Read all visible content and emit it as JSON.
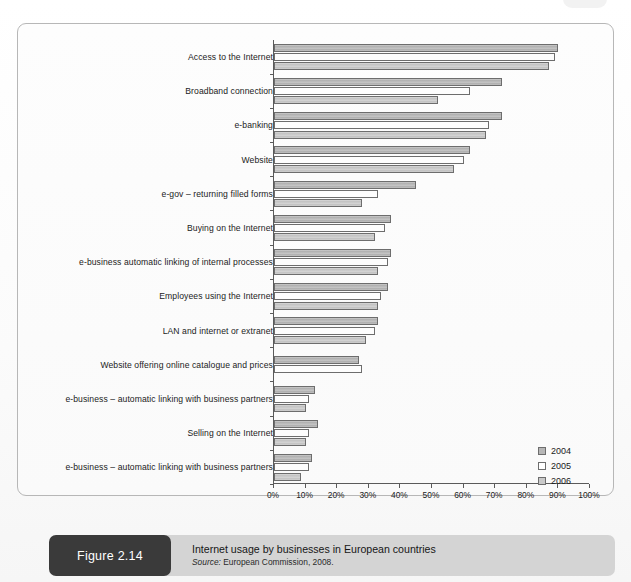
{
  "figure": {
    "tag": "Figure 2.14",
    "title": "Internet usage by businesses in European countries",
    "source_prefix": "Source:",
    "source_text": "European Commission, 2008."
  },
  "legend": {
    "position": "bottom-right",
    "items": [
      {
        "label": "2004",
        "color": "#b6b6b6",
        "swatch": "y2004"
      },
      {
        "label": "2005",
        "color": "#ffffff",
        "swatch": "y2005"
      },
      {
        "label": "2006",
        "color": "#c9c9c9",
        "swatch": "y2006"
      }
    ]
  },
  "chart_data": {
    "type": "bar",
    "orientation": "horizontal",
    "title": "Internet usage by businesses in European countries",
    "xlabel": "",
    "ylabel": "",
    "xlim": [
      0,
      100
    ],
    "grid": false,
    "tick_labels": [
      "0%",
      "10%",
      "20%",
      "30%",
      "40%",
      "50%",
      "60%",
      "70%",
      "80%",
      "90%",
      "100%"
    ],
    "tick_values": [
      0,
      10,
      20,
      30,
      40,
      50,
      60,
      70,
      80,
      90,
      100
    ],
    "legend_position": "bottom-right",
    "categories": [
      "Access to the Internet",
      "Broadband connection",
      "e-banking",
      "Website",
      "e-gov – returning filled forms",
      "Buying on the Internet",
      "e-business automatic linking of internal processes",
      "Employees using the Internet",
      "LAN and internet or extranet",
      "Website offering online catalogue and prices",
      "e-business – automatic linking with business partners",
      "Selling on the Internet",
      "e-business – automatic linking with business partners"
    ],
    "series": [
      {
        "name": "2004",
        "values": [
          90,
          72,
          72,
          62,
          45,
          37,
          37,
          36,
          33,
          27,
          13,
          14,
          12
        ]
      },
      {
        "name": "2005",
        "values": [
          89,
          62,
          68,
          60,
          33,
          35,
          36,
          34,
          32,
          28,
          11,
          11,
          11
        ]
      },
      {
        "name": "2006",
        "values": [
          87,
          52,
          67,
          57,
          28,
          32,
          33,
          33,
          29,
          null,
          10,
          10,
          8.5
        ]
      }
    ]
  }
}
